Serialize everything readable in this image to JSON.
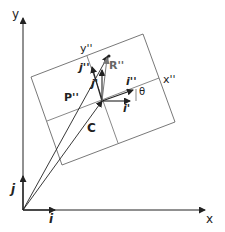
{
  "labels": {
    "y_axis": "y",
    "x_axis": "x",
    "y_dd": "y''",
    "x_dd": "x''",
    "R_dd": "R''",
    "P_dd": "P''",
    "C": "C",
    "i_dd": "i''",
    "j_dd": "j''",
    "i_prime": "i'",
    "j_prime": "j'",
    "theta": "θ",
    "i": "i",
    "j": "j"
  },
  "colors": {
    "line": "#222222",
    "box": "#555555",
    "R": "#777777"
  }
}
